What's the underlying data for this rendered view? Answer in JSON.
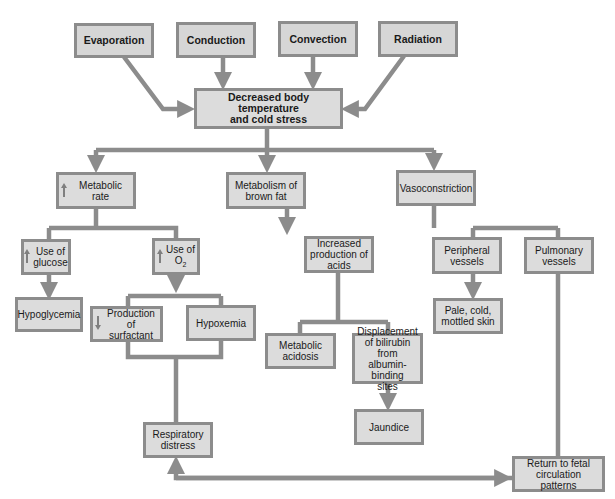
{
  "diagram": {
    "colors": {
      "box_fill": "#dcdcdc",
      "box_border": "#8c8c8c",
      "connector": "#8c8c8c",
      "text": "#1a1a1a"
    },
    "sources": [
      {
        "id": "evaporation",
        "label": "Evaporation"
      },
      {
        "id": "conduction",
        "label": "Conduction"
      },
      {
        "id": "convection",
        "label": "Convection"
      },
      {
        "id": "radiation",
        "label": "Radiation"
      }
    ],
    "central": {
      "line1": "Decreased body temperature",
      "line2": "and cold stress"
    },
    "branches": {
      "metabolic_rate": {
        "indicator": "up-arrow",
        "label": "Metabolic rate"
      },
      "brown_fat": {
        "line1": "Metabolism of",
        "line2": "brown fat"
      },
      "vasoconstriction": {
        "label": "Vasoconstriction"
      }
    },
    "nodes": {
      "use_glucose": {
        "indicator": "up-arrow",
        "line1": "Use of",
        "line2": "glucose"
      },
      "use_o2": {
        "indicator": "up-arrow",
        "line1": "Use of",
        "line2": "O",
        "line2_sub": "2"
      },
      "hypoglycemia": {
        "label": "Hypoglycemia"
      },
      "surfactant": {
        "indicator": "down-arrow",
        "line1": "Production of",
        "line2": "surfactant"
      },
      "hypoxemia": {
        "label": "Hypoxemia"
      },
      "respiratory_distress": {
        "line1": "Respiratory",
        "line2": "distress"
      },
      "increased_acids": {
        "line1": "Increased",
        "line2": "production of",
        "line3": "acids"
      },
      "metabolic_acidosis": {
        "line1": "Metabolic",
        "line2": "acidosis"
      },
      "bilirubin": {
        "line1": "Displacement",
        "line2": "of bilirubin from",
        "line3": "albumin-binding",
        "line4": "sites"
      },
      "jaundice": {
        "label": "Jaundice"
      },
      "peripheral_vessels": {
        "line1": "Peripheral",
        "line2": "vessels"
      },
      "pulmonary_vessels": {
        "line1": "Pulmonary",
        "line2": "vessels"
      },
      "pale_skin": {
        "line1": "Pale, cold,",
        "line2": "mottled skin"
      },
      "fetal_circulation": {
        "line1": "Return to fetal",
        "line2": "circulation patterns"
      }
    }
  }
}
